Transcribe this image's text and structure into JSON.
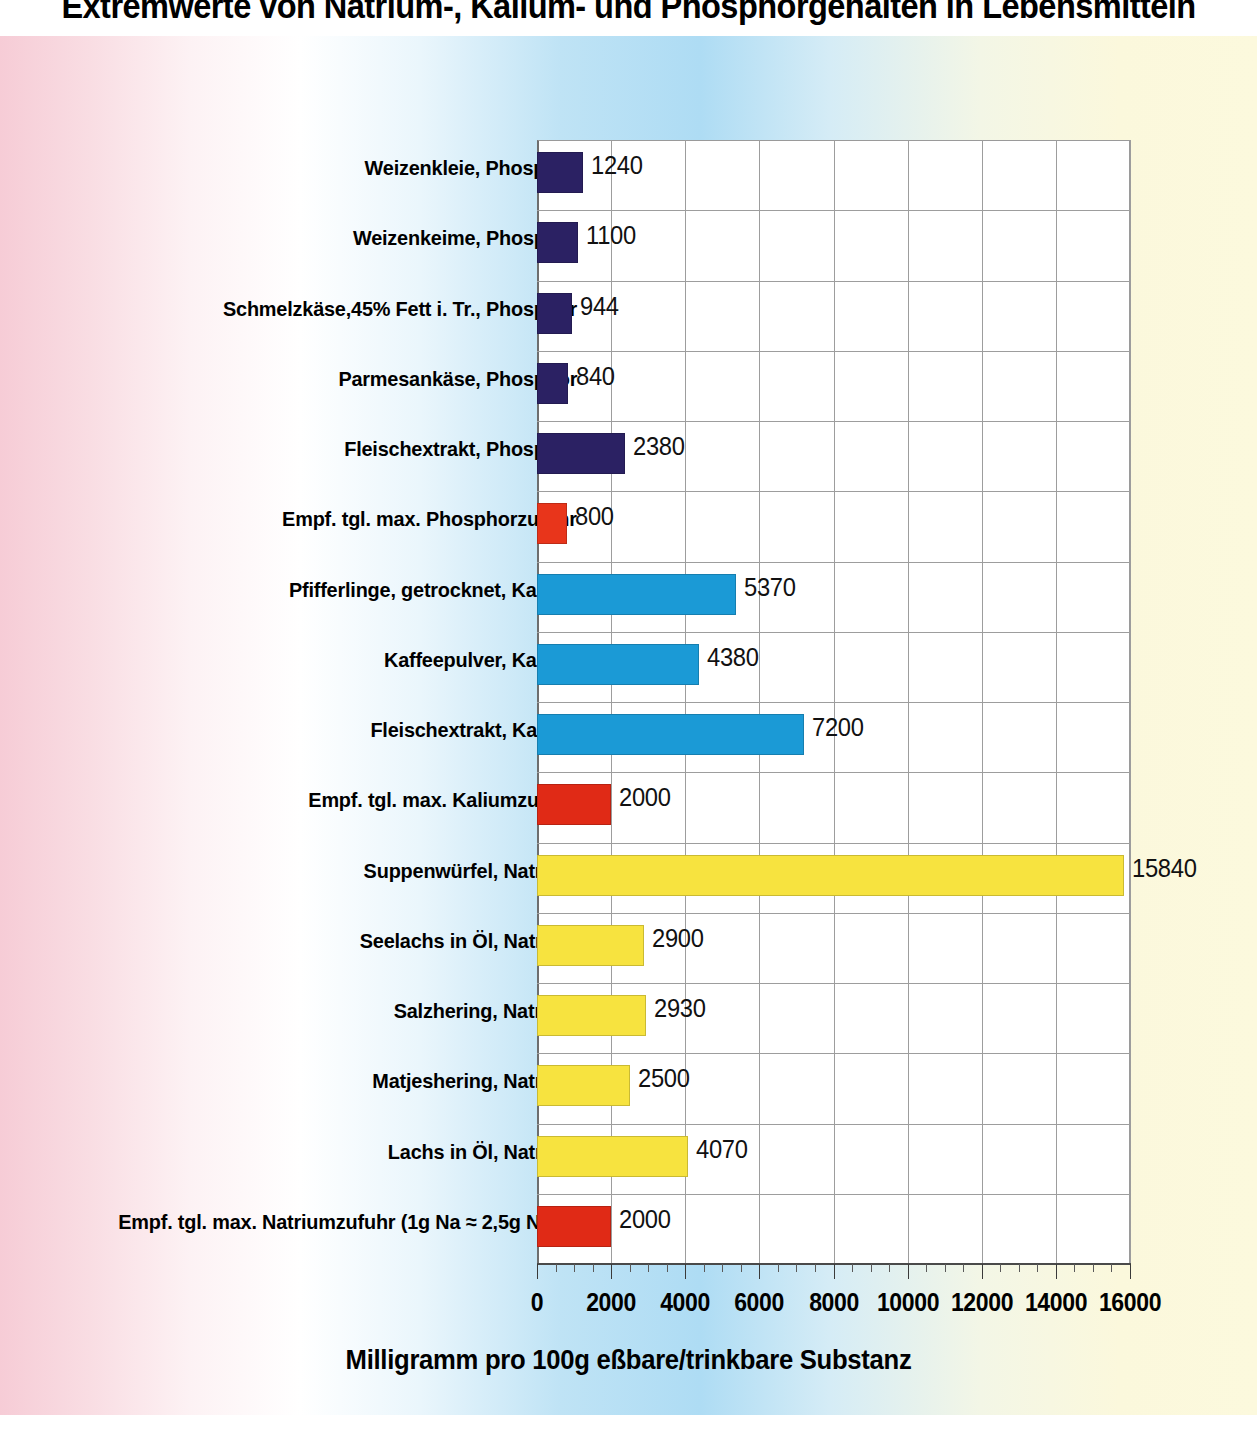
{
  "chart_data": {
    "type": "bar",
    "orientation": "horizontal",
    "title": "Extremwerte von Natrium-, Kalium- und Phosphorgehalten in Lebensmitteln",
    "xlabel": "Milligramm pro 100g eßbare/trinkbare Substanz",
    "ylabel": "",
    "xlim": [
      0,
      16000
    ],
    "xticks": [
      0,
      2000,
      4000,
      6000,
      8000,
      10000,
      12000,
      14000,
      16000
    ],
    "xtick_labels": [
      "0",
      "2000",
      "4000",
      "6000",
      "8000",
      "10000",
      "12000",
      "14000",
      "16000"
    ],
    "xtick_minor_step": 500,
    "grid": true,
    "legend": "none",
    "categories": [
      "Weizenkleie, Phosphor",
      "Weizenkeime, Phosphor",
      "Schmelzkäse,45% Fett i. Tr., Phosphor",
      "Parmesankäse, Phosphor",
      "Fleischextrakt, Phosphor",
      "Empf. tgl. max. Phosphorzufuhr",
      "Pfifferlinge, getrocknet, Kalium",
      "Kaffeepulver, Kalium",
      "Fleischextrakt, Kalium",
      "Empf. tgl. max. Kaliumzufuhr",
      "Suppenwürfel, Natrium",
      "Seelachs in  Öl, Natrium",
      "Salzhering, Natrium",
      "Matjeshering, Natrium",
      "Lachs in Öl, Natrium",
      "Empf. tgl. max. Natriumzufuhr (1g Na  ≈ 2,5g NaCl)"
    ],
    "values": [
      1240,
      1100,
      944,
      840,
      2380,
      800,
      5370,
      4380,
      7200,
      2000,
      15840,
      2900,
      2930,
      2500,
      4070,
      2000
    ],
    "value_labels": [
      "1240",
      "1100",
      "944",
      "840",
      "2380",
      "800",
      "5370",
      "4380",
      "7200",
      "2000",
      "15840",
      "2900",
      "2930",
      "2500",
      "4070",
      "2000"
    ],
    "bar_colors": [
      "#2b2163",
      "#2b2163",
      "#2b2163",
      "#2b2163",
      "#2b2163",
      "#e8351b",
      "#1b9ad6",
      "#1b9ad6",
      "#1b9ad6",
      "#e02a16",
      "#f7e33f",
      "#f7e33f",
      "#f7e33f",
      "#f7e33f",
      "#f7e33f",
      "#e02a16"
    ],
    "series_groups": [
      {
        "name": "Phosphor",
        "color": "#2b2163"
      },
      {
        "name": "Kalium",
        "color": "#1b9ad6"
      },
      {
        "name": "Natrium",
        "color": "#f7e33f"
      },
      {
        "name": "Empfohlene Maximalzufuhr",
        "color": "#e02a16"
      }
    ]
  },
  "colors": {
    "phosphor": "#2b2163",
    "kalium": "#1b9ad6",
    "natrium": "#f7e33f",
    "limit": "#e02a16",
    "grid": "#9d9d9d",
    "plot_background": "#ffffff",
    "page_left": "#f6ccd6",
    "page_middle": "#aedcf4",
    "page_right": "#fbf8dc"
  }
}
